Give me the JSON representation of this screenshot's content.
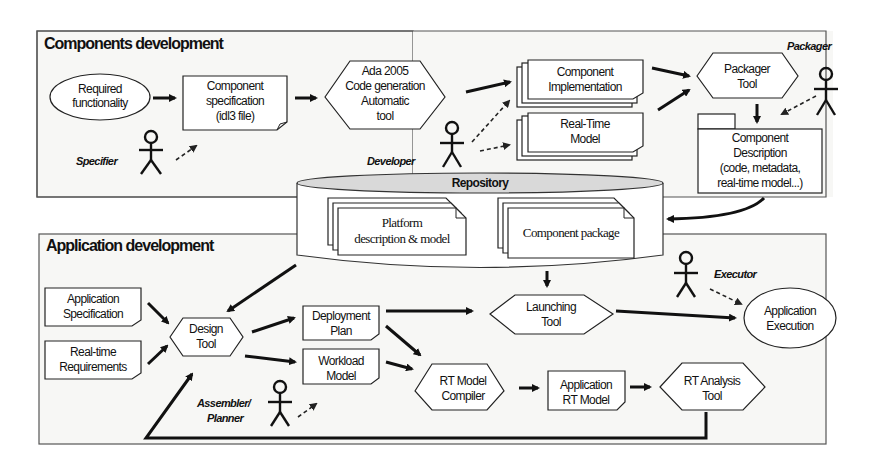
{
  "panels": {
    "components": {
      "title": "Components development"
    },
    "application": {
      "title": "Application development"
    }
  },
  "components": {
    "required": [
      "Required",
      "functionality"
    ],
    "spec": [
      "Component",
      "specification",
      "(idl3 file)"
    ],
    "codegen": [
      "Ada 2005",
      "Code generation",
      "Automatic",
      "tool"
    ],
    "impl": [
      "Component",
      "Implementation"
    ],
    "rtmodel": [
      "Real-Time",
      "Model"
    ],
    "packager_tool": [
      "Packager",
      "Tool"
    ],
    "description": [
      "Component",
      "Description",
      "(code, metadata,",
      "real-time model...)"
    ]
  },
  "roles": {
    "specifier": "Specifier",
    "developer": "Developer",
    "packager": "Packager",
    "executor": "Executor",
    "assembler": "Assembler/",
    "planner": "Planner"
  },
  "repository": {
    "label": "Repository",
    "platform": [
      "Platform",
      "description & model"
    ],
    "package": "Component package"
  },
  "application": {
    "app_spec": [
      "Application",
      "Specification"
    ],
    "rt_req": [
      "Real-time",
      "Requirements"
    ],
    "design_tool": [
      "Design",
      "Tool"
    ],
    "deployment": [
      "Deployment",
      "Plan"
    ],
    "workload": [
      "Workload",
      "Model"
    ],
    "launching": [
      "Launching",
      "Tool"
    ],
    "execution": [
      "Application",
      "Execution"
    ],
    "compiler": [
      "RT Model",
      "Compiler"
    ],
    "app_rt_model": [
      "Application",
      "RT Model"
    ],
    "analysis": [
      "RT Analysis",
      "Tool"
    ]
  }
}
